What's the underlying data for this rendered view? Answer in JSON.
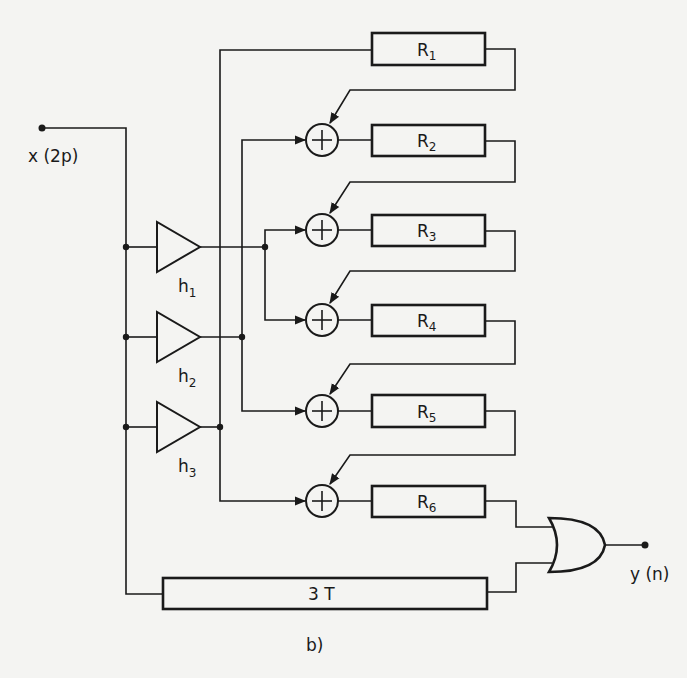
{
  "figure": {
    "caption": "b)",
    "input_label": "x (2p)",
    "output_label": "y (n)",
    "delay_label": "3 T",
    "amplifiers": [
      {
        "name": "h",
        "sub": "1"
      },
      {
        "name": "h",
        "sub": "2"
      },
      {
        "name": "h",
        "sub": "3"
      }
    ],
    "registers": [
      {
        "name": "R",
        "sub": "1"
      },
      {
        "name": "R",
        "sub": "2"
      },
      {
        "name": "R",
        "sub": "3"
      },
      {
        "name": "R",
        "sub": "4"
      },
      {
        "name": "R",
        "sub": "5"
      },
      {
        "name": "R",
        "sub": "6"
      }
    ],
    "adder_symbol": "+",
    "gate": "OR",
    "colors": {
      "ink": "#1a1a1a",
      "paper": "#f4f4f2"
    }
  }
}
